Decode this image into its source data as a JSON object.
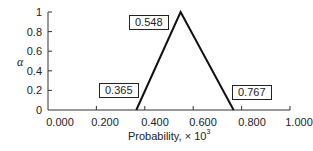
{
  "chart_data": {
    "type": "line",
    "title": "",
    "xlabel": "Probability, × 10",
    "xlabel_sup": "3",
    "ylabel": "α",
    "xlim": [
      0,
      1
    ],
    "ylim": [
      0,
      1
    ],
    "x_ticks": [
      "0.000",
      "0.200",
      "0.400",
      "0.600",
      "0.800",
      "1.000"
    ],
    "y_ticks": [
      "0",
      "0.2",
      "0.4",
      "0.6",
      "0.8",
      "1"
    ],
    "grid": false,
    "series": [
      {
        "name": "triangular fuzzy number",
        "x": [
          0.365,
          0.548,
          0.767
        ],
        "y": [
          0,
          1,
          0
        ]
      }
    ],
    "annotations": [
      "0.365",
      "0.548",
      "0.767"
    ]
  }
}
